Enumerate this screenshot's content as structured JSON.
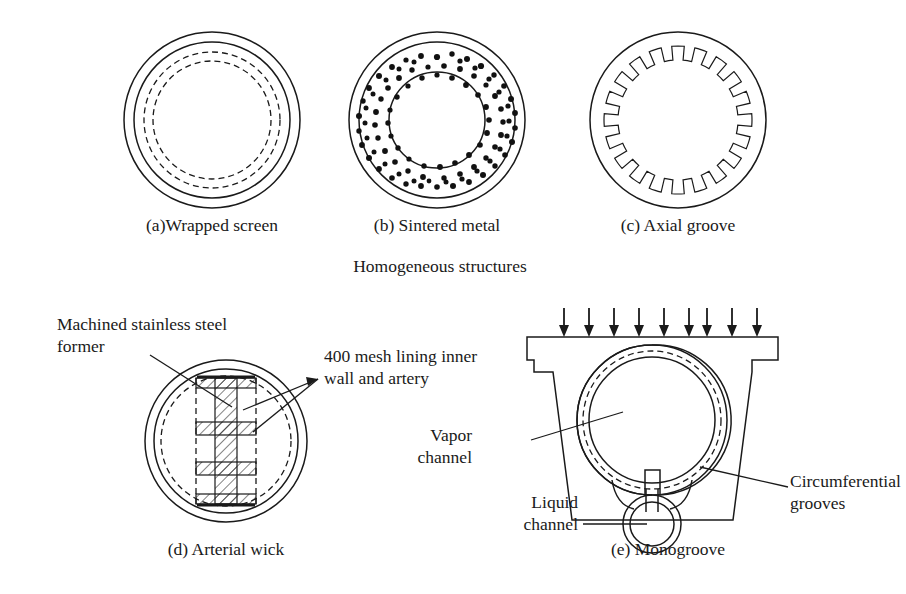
{
  "figure": {
    "group_caption": "Homogeneous structures",
    "panels": [
      {
        "id": "a",
        "caption": "(a)Wrapped screen",
        "type": "wrapped-screen"
      },
      {
        "id": "b",
        "caption": "(b) Sintered metal",
        "type": "sintered-metal"
      },
      {
        "id": "c",
        "caption": "(c) Axial groove",
        "type": "axial-groove",
        "groove_count": 20
      },
      {
        "id": "d",
        "caption": "(d) Arterial wick",
        "type": "arterial-wick"
      },
      {
        "id": "e",
        "caption": "(e) Monogroove",
        "type": "monogroove",
        "heat_arrow_count": 9
      }
    ],
    "annotations": {
      "machined_former_line1": "Machined stainless steel",
      "machined_former_line2": "former",
      "mesh_lining_line1": "400 mesh lining inner",
      "mesh_lining_line2": "wall and artery",
      "vapor_channel_line1": "Vapor",
      "vapor_channel_line2": "channel",
      "liquid_channel_line1": "Liquid",
      "liquid_channel_line2": "channel",
      "circumferential_line1": "Circumferential",
      "circumferential_line2": "grooves"
    },
    "colors": {
      "ink": "#1a1a1a",
      "background": "#ffffff"
    }
  }
}
